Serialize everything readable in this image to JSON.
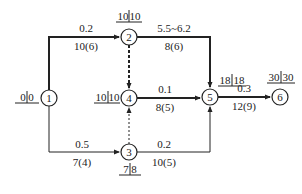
{
  "diagram": {
    "type": "activity-on-arrow network",
    "colors": {
      "line": "#222222",
      "background": "#ffffff"
    },
    "nodes": [
      {
        "id": "1",
        "label": "1",
        "x": 49,
        "y": 98,
        "time": "0|0",
        "time_left": "0",
        "time_right": "0"
      },
      {
        "id": "2",
        "label": "2",
        "x": 129,
        "y": 37,
        "time": "10|10",
        "time_left": "10",
        "time_right": "10"
      },
      {
        "id": "3",
        "label": "3",
        "x": 129,
        "y": 152,
        "time": "7|8",
        "time_left": "7",
        "time_right": "8"
      },
      {
        "id": "4",
        "label": "4",
        "x": 129,
        "y": 98,
        "time": "10|10",
        "time_left": "10",
        "time_right": "10"
      },
      {
        "id": "5",
        "label": "5",
        "x": 210,
        "y": 97,
        "time": "18|18",
        "time_left": "18",
        "time_right": "18"
      },
      {
        "id": "6",
        "label": "6",
        "x": 280,
        "y": 97,
        "time": "30|30",
        "time_left": "30",
        "time_right": "30"
      }
    ],
    "edges": [
      {
        "from": "1",
        "to": "2",
        "top": "0.2",
        "bottom": "10(6)",
        "style": "solid",
        "critical": true
      },
      {
        "from": "1",
        "to": "3",
        "top": "0.5",
        "bottom": "7(4)",
        "style": "solid",
        "critical": false
      },
      {
        "from": "2",
        "to": "4",
        "top": "",
        "bottom": "",
        "style": "dashed",
        "critical": true
      },
      {
        "from": "3",
        "to": "4",
        "top": "",
        "bottom": "",
        "style": "dashed",
        "critical": false
      },
      {
        "from": "2",
        "to": "5",
        "top": "5.5~6.2",
        "bottom": "8(6)",
        "style": "solid",
        "critical": true
      },
      {
        "from": "4",
        "to": "5",
        "top": "0.1",
        "bottom": "8(5)",
        "style": "solid",
        "critical": true
      },
      {
        "from": "3",
        "to": "5",
        "top": "0.2",
        "bottom": "10(5)",
        "style": "solid",
        "critical": false
      },
      {
        "from": "5",
        "to": "6",
        "top": "0.3",
        "bottom": "12(9)",
        "style": "solid",
        "critical": true
      }
    ]
  }
}
